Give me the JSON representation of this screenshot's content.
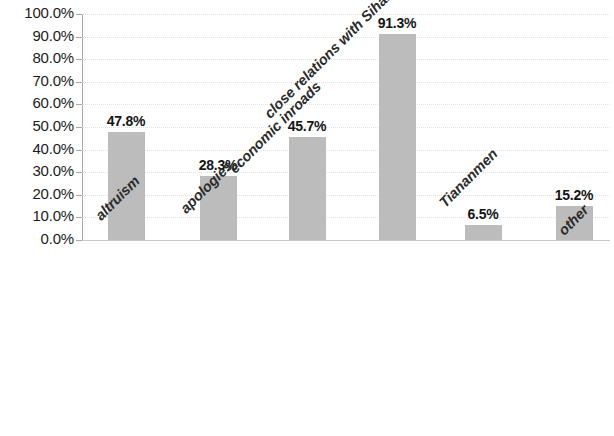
{
  "chart_data": {
    "type": "bar",
    "title": "",
    "subtitle": "",
    "xlabel": "",
    "ylabel": "",
    "categories": [
      "altruism",
      "apologies",
      "economic inroads",
      "close relations with Sihanouk",
      "Tiananmen",
      "other"
    ],
    "values": [
      47.8,
      28.3,
      45.7,
      91.3,
      6.5,
      15.2
    ],
    "value_labels": [
      "47.8%",
      "28.3%",
      "45.7%",
      "91.3%",
      "6.5%",
      "15.2%"
    ],
    "ylim": [
      0,
      100
    ],
    "y_tick_step": 10,
    "y_tick_labels": [
      "100.0%",
      "90.0%",
      "80.0%",
      "70.0%",
      "60.0%",
      "50.0%",
      "40.0%",
      "30.0%",
      "20.0%",
      "10.0%",
      "0.0%"
    ],
    "y_tick_values": [
      100,
      90,
      80,
      70,
      60,
      50,
      40,
      30,
      20,
      10,
      0
    ],
    "grid": true,
    "grid_axis": "y",
    "legend": false,
    "legend_position": "none",
    "bar_color": "#bcbcbc",
    "text_color": "#1b1b1b",
    "grid_color": "#dcdcdc",
    "axis_color": "#a8a8a8",
    "category_label_rotation": -45,
    "data_labels_shown": true
  }
}
